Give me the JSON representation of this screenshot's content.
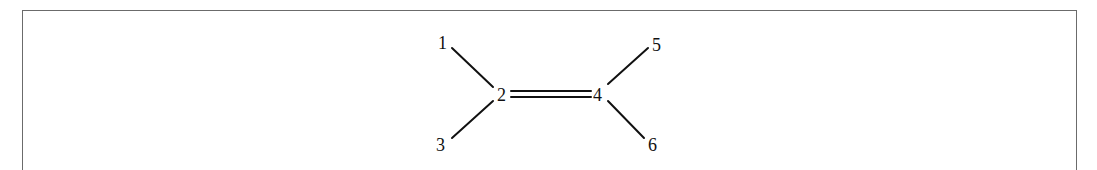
{
  "diagram": {
    "type": "molecule-structure",
    "atoms": [
      {
        "id": "1",
        "label": "1",
        "x": 440,
        "y": 36
      },
      {
        "id": "2",
        "label": "2",
        "x": 497,
        "y": 86
      },
      {
        "id": "3",
        "label": "3",
        "x": 437,
        "y": 136
      },
      {
        "id": "4",
        "label": "4",
        "x": 593,
        "y": 86
      },
      {
        "id": "5",
        "label": "5",
        "x": 652,
        "y": 36
      },
      {
        "id": "6",
        "label": "6",
        "x": 650,
        "y": 136
      }
    ],
    "bonds": [
      {
        "from": "1",
        "to": "2",
        "order": 1
      },
      {
        "from": "3",
        "to": "2",
        "order": 1
      },
      {
        "from": "2",
        "to": "4",
        "order": 2
      },
      {
        "from": "4",
        "to": "5",
        "order": 1
      },
      {
        "from": "4",
        "to": "6",
        "order": 1
      }
    ]
  }
}
